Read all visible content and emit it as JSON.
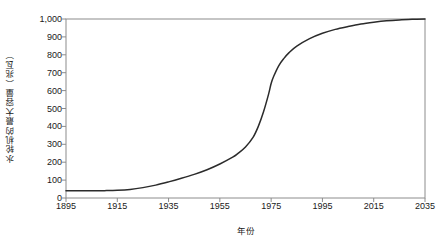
{
  "chart_data": {
    "type": "line",
    "title": "",
    "xlabel": "年份",
    "ylabel": "水轮机的最大容量（兆瓦）",
    "xlim": [
      1895,
      2035
    ],
    "ylim": [
      0,
      1000
    ],
    "grid": false,
    "legend": "none",
    "x_ticks": [
      "1895",
      "1915",
      "1935",
      "1955",
      "1975",
      "1995",
      "2015",
      "2035"
    ],
    "x_tick_values": [
      1895,
      1915,
      1935,
      1955,
      1975,
      1995,
      2015,
      2035
    ],
    "y_ticks": [
      "0",
      "100",
      "200",
      "300",
      "400",
      "500",
      "600",
      "700",
      "800",
      "900",
      "1,000"
    ],
    "y_tick_values": [
      0,
      100,
      200,
      300,
      400,
      500,
      600,
      700,
      800,
      900,
      1000
    ],
    "series": [
      {
        "name": "水轮机的最大容量",
        "color": "#2b2b2b",
        "x": [
          1895,
          1900,
          1905,
          1910,
          1915,
          1920,
          1925,
          1930,
          1935,
          1940,
          1945,
          1950,
          1955,
          1960,
          1962,
          1965,
          1968,
          1970,
          1972,
          1974,
          1975,
          1976,
          1978,
          1980,
          1982,
          1985,
          1990,
          1995,
          2000,
          2005,
          2010,
          2015,
          2020,
          2025,
          2030,
          2035
        ],
        "values": [
          40,
          40,
          40,
          41,
          43,
          48,
          58,
          72,
          90,
          110,
          132,
          158,
          190,
          228,
          248,
          285,
          340,
          400,
          480,
          580,
          640,
          680,
          740,
          780,
          812,
          848,
          890,
          920,
          942,
          958,
          972,
          982,
          990,
          995,
          998,
          1000
        ]
      }
    ]
  }
}
